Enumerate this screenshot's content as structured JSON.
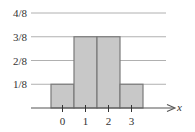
{
  "chart_data": {
    "type": "bar",
    "title": "",
    "xlabel": "x",
    "ylabel": "",
    "categories": [
      "0",
      "1",
      "2",
      "3"
    ],
    "values": [
      0.125,
      0.375,
      0.375,
      0.125
    ],
    "value_labels": [
      "1/8",
      "3/8",
      "3/8",
      "1/8"
    ],
    "y_ticks": [
      {
        "value": 0.125,
        "label": "1/8"
      },
      {
        "value": 0.25,
        "label": "2/8"
      },
      {
        "value": 0.375,
        "label": "3/8"
      },
      {
        "value": 0.5,
        "label": "4/8"
      }
    ],
    "ylim": [
      0,
      0.5
    ],
    "grid": true,
    "legend": null,
    "bar_fill": "#c8c8c8",
    "bar_edge": "#7a7a7a",
    "grid_color": "#b0b0b0",
    "axis_color": "#555555"
  }
}
